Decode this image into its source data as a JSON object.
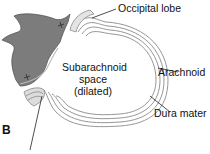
{
  "diagram": {
    "panel_label": "B",
    "labels": {
      "occipital_lobe": "Occipital lobe",
      "arachnoid": "Arachnoid",
      "dura_mater": "Dura mater"
    },
    "center_label": {
      "line1": "Subarachnoid",
      "line2": "space",
      "line3": "(dilated)"
    },
    "colors": {
      "brain_tissue": "#7a7a7a",
      "membrane": "#999999",
      "membrane_fill": "#e6e6e6",
      "text": "#111111"
    }
  }
}
